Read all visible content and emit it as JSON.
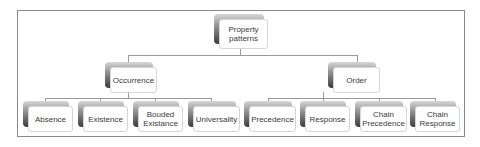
{
  "diagram": {
    "root": {
      "label": "Property patterns"
    },
    "groups": [
      {
        "label": "Occurrence",
        "children": [
          "Absence",
          "Existence",
          "Bouded Existance",
          "Universality"
        ]
      },
      {
        "label": "Order",
        "children": [
          "Precedence",
          "Response",
          "Chain Precedence",
          "Chain Response"
        ]
      }
    ]
  }
}
